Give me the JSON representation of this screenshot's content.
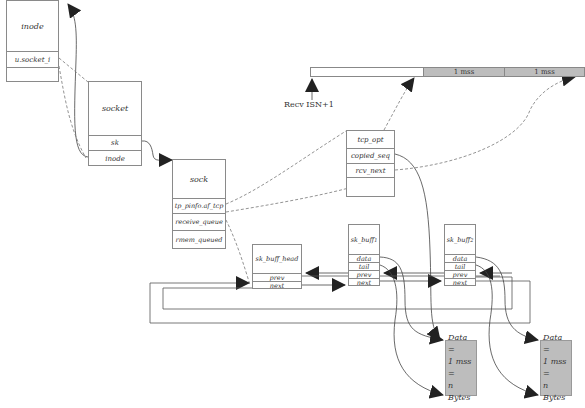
{
  "diagram": {
    "inode": {
      "title": "inode",
      "fields": [
        "u.socket_i",
        ""
      ]
    },
    "socket": {
      "title": "socket",
      "fields": [
        "sk",
        "inode"
      ]
    },
    "sock": {
      "title": "sock",
      "fields": [
        "tp_pinfo.af_tcp",
        "receive_queue",
        "rmem_queued"
      ]
    },
    "tcp_opt": {
      "fields": [
        "tcp_opt",
        "copied_seq",
        "rcv_next",
        ""
      ]
    },
    "sk_buff_head": {
      "title": "sk_buff_head",
      "fields": [
        "prev",
        "next"
      ]
    },
    "sk_buff_1": {
      "title": "sk_buff",
      "subscript": "1",
      "fields": [
        "data",
        "tail",
        "prev",
        "next"
      ]
    },
    "sk_buff_2": {
      "title": "sk_buff",
      "subscript": "2",
      "fields": [
        "data",
        "tail",
        "prev",
        "next"
      ]
    },
    "data_blocks": [
      {
        "lines": [
          "Data =",
          "1 mss =",
          "n Bytes"
        ]
      },
      {
        "lines": [
          "Data =",
          "1 mss =",
          "n Bytes"
        ]
      }
    ],
    "sequence_bar": {
      "segments": [
        {
          "label": "",
          "fill": "#ffffff"
        },
        {
          "label": "1 mss",
          "fill": "#bdbdbd"
        },
        {
          "label": "1 mss",
          "fill": "#bdbdbd"
        }
      ],
      "start_label": "Recv ISN+1"
    },
    "colors": {
      "line": "#555555",
      "box_border": "#8a8a8a",
      "data_fill": "#bdbdbd",
      "arrow": "#222222"
    }
  }
}
